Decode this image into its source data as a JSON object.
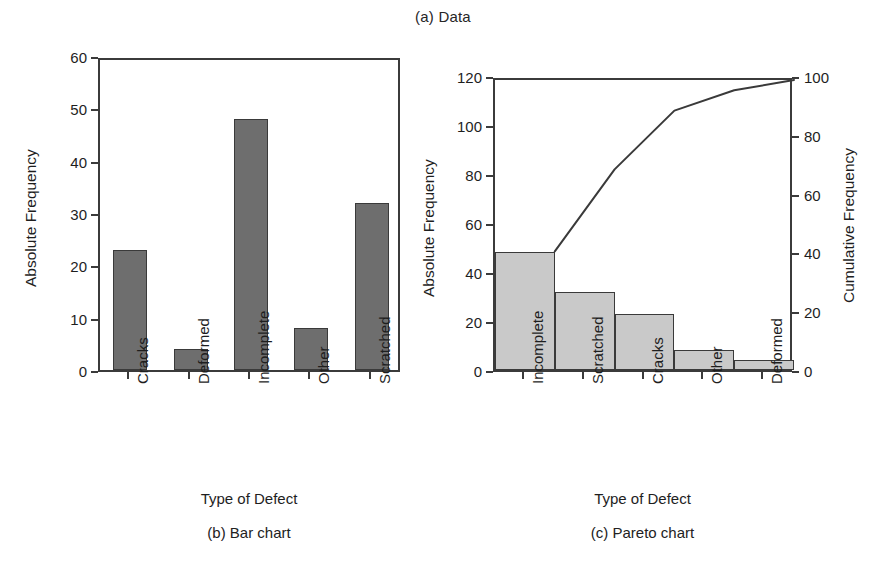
{
  "figure": {
    "title": "(a) Data"
  },
  "panels": [
    {
      "caption": "(b)  Bar chart",
      "xlabel": "Type of Defect",
      "ylabel": "Absolute Frequency"
    },
    {
      "caption": "(c)  Pareto chart",
      "xlabel": "Type of Defect",
      "ylabel": "Absolute Frequency",
      "y2label": "Cumulative Frequency"
    }
  ],
  "chart_data": [
    {
      "type": "bar",
      "title": "(b)  Bar chart",
      "categories": [
        "Cracks",
        "Deformed",
        "Incomplete",
        "Other",
        "Scratched"
      ],
      "values": [
        23,
        4,
        48,
        8,
        32
      ],
      "xlabel": "Type of Defect",
      "ylabel": "Absolute Frequency",
      "ylim": [
        0,
        60
      ],
      "yticks": [
        0,
        10,
        20,
        30,
        40,
        50,
        60
      ],
      "ytick_labels": [
        "0",
        "10",
        "20",
        "30",
        "40",
        "50",
        "60"
      ],
      "grid": false,
      "legend": "none",
      "bar_color": "#6e6e6e",
      "bar_edge_color": "#3a3a3a"
    },
    {
      "type": "bar",
      "title": "(c)  Pareto chart",
      "categories": [
        "Incomplete",
        "Scratched",
        "Cracks",
        "Other",
        "Deformed"
      ],
      "values": [
        48,
        32,
        23,
        8,
        4
      ],
      "xlabel": "Type of Defect",
      "ylabel": "Absolute Frequency",
      "ylim": [
        0,
        120
      ],
      "yticks": [
        0,
        20,
        40,
        60,
        80,
        100,
        120
      ],
      "ytick_labels": [
        "0",
        "20",
        "40",
        "60",
        "80",
        "100",
        "120"
      ],
      "y2label": "Cumulative Frequency",
      "y2lim": [
        0,
        100
      ],
      "y2ticks": [
        0,
        20,
        40,
        60,
        80,
        100
      ],
      "y2tick_labels": [
        "0",
        "20",
        "40",
        "60",
        "80",
        "100"
      ],
      "series": [
        {
          "name": "Cumulative Frequency",
          "type": "line",
          "axis": "right",
          "values": [
            41.7,
            69.6,
            89.6,
            96.5,
            100.0
          ]
        }
      ],
      "grid": false,
      "legend": "none",
      "bar_color": "#c9c9c9",
      "bar_edge_color": "#3a3a3a",
      "line_color": "#3a3a3a"
    }
  ]
}
